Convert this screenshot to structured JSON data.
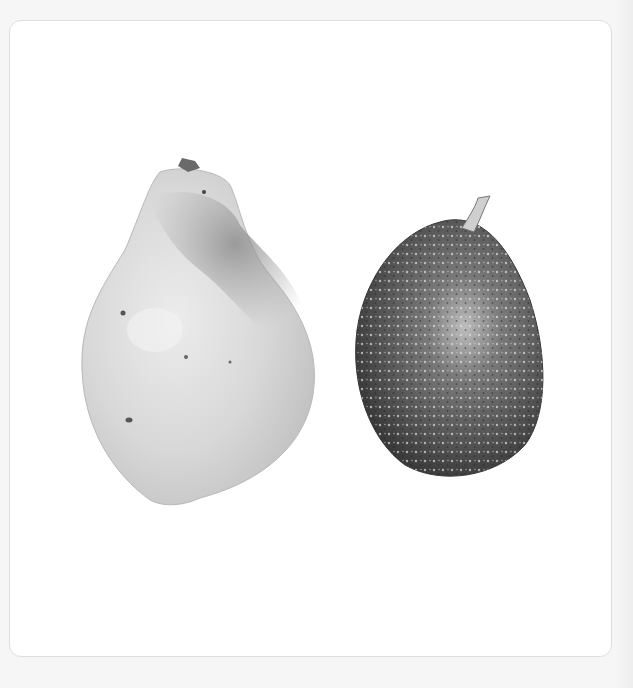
{
  "image": {
    "description": "Grayscale botanical watercolor illustration of two fruits on a white plate with rounded border",
    "subjects": [
      {
        "name": "papaya",
        "position": "left",
        "tone": "light gray with darker mottled upper-right patch"
      },
      {
        "name": "avocado",
        "position": "right",
        "tone": "dark speckled gray with stem"
      }
    ],
    "colors": {
      "page_background": "#f6f6f6",
      "plate_background": "#ffffff",
      "plate_border": "#dedede",
      "papaya_light": "#d9d9d9",
      "papaya_dark": "#9a9a9a",
      "avocado_dark": "#4a4a4a",
      "avocado_mid": "#777777"
    }
  }
}
